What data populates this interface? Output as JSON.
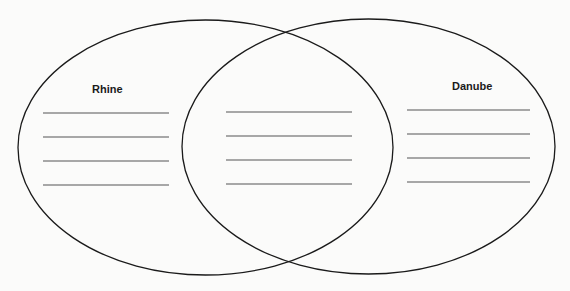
{
  "diagram": {
    "type": "venn",
    "circles": [
      {
        "name": "left-circle",
        "label": "Rhine",
        "cx": 205.5,
        "cy": 147.5,
        "rx": 187.5,
        "ry": 127.5
      },
      {
        "name": "right-circle",
        "label": "Danube",
        "cx": 368.5,
        "cy": 146.5,
        "rx": 186.5,
        "ry": 127.5
      }
    ],
    "labels": {
      "left": "Rhine",
      "right": "Danube",
      "middle": ""
    },
    "line_sets": {
      "left": {
        "x1": 43,
        "x2": 169,
        "ys": [
          113,
          137,
          161,
          185
        ]
      },
      "middle": {
        "x1": 226,
        "x2": 352,
        "ys": [
          112,
          136,
          160,
          184
        ]
      },
      "right": {
        "x1": 407,
        "x2": 530,
        "ys": [
          110,
          134,
          158,
          182
        ]
      }
    },
    "colors": {
      "outline": "#1a1a1a",
      "lines": "#555555",
      "background": "#fbfbfa"
    }
  }
}
